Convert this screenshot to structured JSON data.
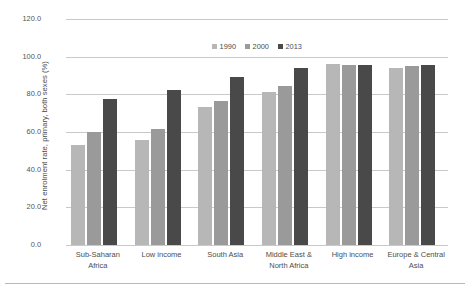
{
  "chart_data": {
    "type": "bar",
    "title": "",
    "subtitle": "",
    "xlabel": "",
    "ylabel": "Net enrolment rate, primary, both sexes (%)",
    "ylim": [
      0.0,
      120.0
    ],
    "ytick_step": 20.0,
    "ytick_labels": [
      "0.0",
      "20.0",
      "40.0",
      "60.0",
      "80.0",
      "100.0",
      "120.0"
    ],
    "ytick_values": [
      0.0,
      20.0,
      40.0,
      60.0,
      80.0,
      100.0,
      120.0
    ],
    "grid": true,
    "legend_position": "top-center",
    "categories": [
      "Sub-Saharan Africa",
      "Low income",
      "South Asia",
      "Middle East & North Africa",
      "High income",
      "Europe & Central Asia"
    ],
    "series": [
      {
        "name": "1990",
        "color": "#b7b7b7",
        "values": [
          53.0,
          55.5,
          73.5,
          81.5,
          96.0,
          94.0
        ]
      },
      {
        "name": "2000",
        "color": "#9a9a9a",
        "values": [
          60.0,
          61.5,
          76.5,
          84.5,
          95.5,
          95.0
        ]
      },
      {
        "name": "2013",
        "color": "#494949",
        "values": [
          77.5,
          82.5,
          89.0,
          94.0,
          95.5,
          95.5
        ]
      }
    ]
  },
  "colors": {
    "gridline": "#c9c9c9",
    "text": "#4d4d4d",
    "background": "#ffffff",
    "rule": "#b9b9b9"
  },
  "x_labels": [
    {
      "line1": "Sub-Saharan",
      "line2": "Africa"
    },
    {
      "line1": "Low income",
      "line2": ""
    },
    {
      "line1": "South Asia",
      "line2": ""
    },
    {
      "line1": "Middle East &",
      "line2": "North Africa"
    },
    {
      "line1": "High income",
      "line2": ""
    },
    {
      "line1": "Europe & Central",
      "line2": "Asia"
    }
  ]
}
